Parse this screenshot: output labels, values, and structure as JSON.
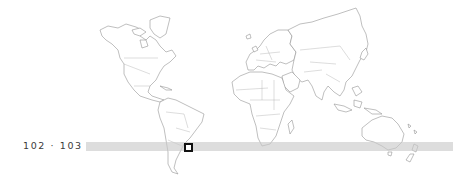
{
  "page_label": "102 · 103",
  "map": {
    "type": "world-outline",
    "projection": "equirectangular-like",
    "line_color": "#8a8a8a",
    "background": "#ffffff"
  },
  "latitude_band": {
    "color": "#d0d0d0",
    "x_start": 86,
    "x_end": 453,
    "y_top": 142,
    "y_bottom": 151
  },
  "location_marker": {
    "shape": "square",
    "border_color": "#111111",
    "x": 184,
    "y": 143
  }
}
